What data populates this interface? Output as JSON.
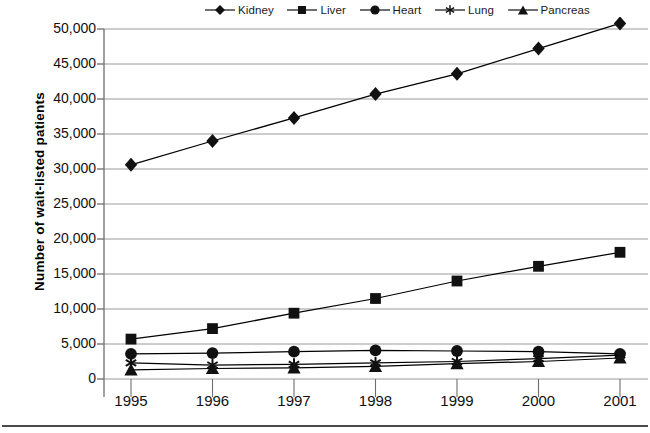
{
  "chart_data": {
    "type": "line",
    "title": "",
    "xlabel": "",
    "ylabel": "Number of wait-listed patients",
    "x": [
      1995,
      1996,
      1997,
      1998,
      1999,
      2000,
      2001
    ],
    "categories": [
      "1995",
      "1996",
      "1997",
      "1998",
      "1999",
      "2000",
      "2001"
    ],
    "ylim": [
      0,
      50000
    ],
    "ytick_labels": [
      "0",
      "5,000",
      "10,000",
      "15,000",
      "20,000",
      "25,000",
      "30,000",
      "35,000",
      "40,000",
      "45,000",
      "50,000"
    ],
    "ytick_values": [
      0,
      5000,
      10000,
      15000,
      20000,
      25000,
      30000,
      35000,
      40000,
      45000,
      50000
    ],
    "grid": "horizontal",
    "legend_position": "top",
    "series": [
      {
        "name": "Kidney",
        "marker": "diamond",
        "color": "#000000",
        "values": [
          30600,
          34000,
          37300,
          40700,
          43600,
          47200,
          50800
        ],
        "note": "2001 value extends above the 50,000 axis maximum and is clipped"
      },
      {
        "name": "Liver",
        "marker": "square",
        "color": "#000000",
        "values": [
          5700,
          7200,
          9400,
          11500,
          14000,
          16100,
          18100
        ]
      },
      {
        "name": "Heart",
        "marker": "circle",
        "color": "#000000",
        "values": [
          3600,
          3700,
          3900,
          4100,
          4000,
          3900,
          3600
        ]
      },
      {
        "name": "Lung",
        "marker": "asterisk",
        "color": "#000000",
        "values": [
          2300,
          2000,
          2100,
          2300,
          2500,
          2900,
          3400
        ]
      },
      {
        "name": "Pancreas",
        "marker": "triangle",
        "color": "#000000",
        "values": [
          1300,
          1500,
          1600,
          1800,
          2200,
          2500,
          3000
        ]
      }
    ]
  },
  "legend": {
    "items": [
      {
        "label": "Kidney",
        "marker": "diamond"
      },
      {
        "label": "Liver",
        "marker": "square"
      },
      {
        "label": "Heart",
        "marker": "circle"
      },
      {
        "label": "Lung",
        "marker": "asterisk"
      },
      {
        "label": "Pancreas",
        "marker": "triangle"
      }
    ]
  },
  "axes": {
    "y_title": "Number of wait-listed patients",
    "y_ticks": [
      "50,000",
      "45,000",
      "40,000",
      "35,000",
      "30,000",
      "25,000",
      "20,000",
      "15,000",
      "10,000",
      "5,000",
      "0"
    ],
    "x_ticks": [
      "1995",
      "1996",
      "1997",
      "1998",
      "1999",
      "2000",
      "2001"
    ]
  },
  "colors": {
    "series": "#000000",
    "gridline": "#9a9a9a",
    "axis": "#6e6e6e",
    "footer_rule": "#4a4a4a",
    "background": "#ffffff"
  }
}
